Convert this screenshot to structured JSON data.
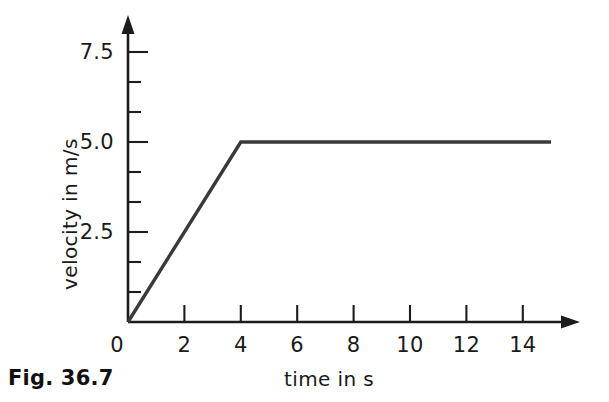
{
  "caption": "Fig. 36.7",
  "chart_data": {
    "type": "line",
    "title": "",
    "subtitle": "",
    "xlabel": "time in s",
    "ylabel": "velocity in m/s",
    "xlim": [
      0,
      15.5
    ],
    "ylim": [
      0,
      8.0
    ],
    "grid": false,
    "legend": null,
    "x_ticks_major": [
      0,
      2,
      4,
      6,
      8,
      10,
      12,
      14
    ],
    "x_tick_labels": [
      "0",
      "2",
      "4",
      "6",
      "8",
      "10",
      "12",
      "14"
    ],
    "y_ticks_major": [
      2.5,
      5.0,
      7.5
    ],
    "y_tick_labels": [
      "2.5",
      "5.0",
      "7.5"
    ],
    "y_ticks_minor": [
      0.833,
      1.667,
      3.333,
      4.167,
      5.833,
      6.667
    ],
    "axis_style": "arrow-ended",
    "x_tick_direction": "up",
    "y_tick_direction": "right",
    "series": [
      {
        "name": "velocity",
        "color": "#3a3a3a",
        "x": [
          0,
          4,
          15
        ],
        "y": [
          0,
          5.0,
          5.0
        ],
        "annotations": [
          "linear acceleration from 0 m/s to 5.0 m/s between t = 0 s and t = 4 s",
          "constant velocity of 5.0 m/s from t = 4 s to t = 15 s"
        ]
      }
    ]
  }
}
